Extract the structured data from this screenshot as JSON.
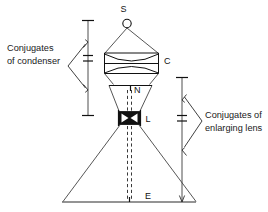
{
  "figure": {
    "background_color": "#ffffff",
    "line_color": "#2b2b2b",
    "text_color": "#111111",
    "width": 268,
    "height": 212
  },
  "annotations": {
    "left": {
      "line1": "Conjugates",
      "line2": "of condenser"
    },
    "right": {
      "line1": "Conjugates of",
      "line2": "enlarging lens"
    }
  },
  "component_labels": {
    "source": "S",
    "condenser": "C",
    "negative": "N",
    "lens": "L",
    "easel": "E"
  },
  "components": [
    {
      "symbol": "S",
      "name": "light source",
      "y": 22
    },
    {
      "symbol": "C",
      "name": "condenser lens pair",
      "y": 60
    },
    {
      "symbol": "N",
      "name": "negative",
      "y": 86
    },
    {
      "symbol": "L",
      "name": "enlarging lens",
      "y": 119
    },
    {
      "symbol": "E",
      "name": "easel / baseboard",
      "y": 202
    }
  ],
  "dimension_chains": {
    "condenser": {
      "label_ref": "annotations.left",
      "from": "S",
      "via": "C",
      "to": "N",
      "segments": [
        "S to C",
        "C to N"
      ]
    },
    "enlarging_lens": {
      "label_ref": "annotations.right",
      "from": "N",
      "via": "L",
      "to": "E",
      "segments": [
        "N to L",
        "L to E"
      ]
    }
  }
}
